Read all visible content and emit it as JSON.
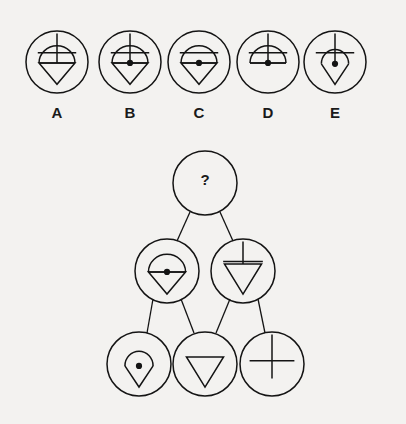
{
  "page": {
    "background_color": "#f3f2f0",
    "ink_color": "#141414",
    "width": 406,
    "height": 424
  },
  "options_row": {
    "label": "Answer options",
    "circle_radius": 31,
    "y_center": 62,
    "label_y": 114,
    "items": [
      {
        "id": "option-a",
        "label": "A",
        "cx": 57,
        "features": {
          "vertical_line": true,
          "horizontal_bar": true,
          "shape": "kite",
          "center_dot": false
        }
      },
      {
        "id": "option-b",
        "label": "B",
        "cx": 130,
        "features": {
          "vertical_line": true,
          "horizontal_bar": true,
          "shape": "kite",
          "center_dot": true
        }
      },
      {
        "id": "option-c",
        "label": "C",
        "cx": 199,
        "features": {
          "vertical_line": false,
          "horizontal_bar": true,
          "shape": "kite",
          "center_dot": true
        }
      },
      {
        "id": "option-d",
        "label": "D",
        "cx": 268,
        "features": {
          "vertical_line": true,
          "horizontal_bar": true,
          "shape": "dome",
          "center_dot": true
        }
      },
      {
        "id": "option-e",
        "label": "E",
        "cx": 335,
        "features": {
          "vertical_line": true,
          "horizontal_bar": true,
          "shape": "narrow-kite",
          "center_dot": true
        }
      }
    ]
  },
  "pyramid": {
    "label": "Figure pyramid",
    "apex": {
      "id": "pyramid-apex",
      "cx": 205,
      "cy": 183,
      "r": 32,
      "content": "?",
      "is_unknown": true
    },
    "middle_row": [
      {
        "id": "pyramid-middle-left",
        "cx": 167,
        "cy": 271,
        "r": 32,
        "features": {
          "vertical_line": false,
          "horizontal_bar": false,
          "shape": "kite",
          "center_dot": true
        }
      },
      {
        "id": "pyramid-middle-right",
        "cx": 243,
        "cy": 271,
        "r": 32,
        "features": {
          "vertical_line": true,
          "horizontal_bar": true,
          "shape": "triangle",
          "center_dot": false
        }
      }
    ],
    "bottom_row": [
      {
        "id": "pyramid-bottom-left",
        "cx": 139,
        "cy": 364,
        "r": 32,
        "features": {
          "vertical_line": false,
          "horizontal_bar": false,
          "shape": "narrow-kite",
          "center_dot": true
        }
      },
      {
        "id": "pyramid-bottom-middle",
        "cx": 205,
        "cy": 364,
        "r": 32,
        "features": {
          "vertical_line": false,
          "horizontal_bar": false,
          "shape": "triangle",
          "center_dot": false
        }
      },
      {
        "id": "pyramid-bottom-right",
        "cx": 272,
        "cy": 364,
        "r": 32,
        "features": {
          "vertical_line": true,
          "horizontal_bar": true,
          "shape": "none",
          "center_dot": false
        }
      }
    ],
    "connectors": [
      {
        "id": "connector-apex-to-middle-left",
        "x1": 190,
        "y1": 212,
        "x2": 177,
        "y2": 241
      },
      {
        "id": "connector-apex-to-middle-right",
        "x1": 220,
        "y1": 212,
        "x2": 233,
        "y2": 241
      },
      {
        "id": "connector-middle-left-to-bottom-left",
        "x1": 153,
        "y1": 299,
        "x2": 147,
        "y2": 333
      },
      {
        "id": "connector-middle-left-to-bottom-middle",
        "x1": 181,
        "y1": 299,
        "x2": 194,
        "y2": 333
      },
      {
        "id": "connector-middle-right-to-bottom-middle",
        "x1": 230,
        "y1": 299,
        "x2": 216,
        "y2": 333
      },
      {
        "id": "connector-middle-right-to-bottom-right",
        "x1": 258,
        "y1": 299,
        "x2": 265,
        "y2": 333
      }
    ]
  }
}
